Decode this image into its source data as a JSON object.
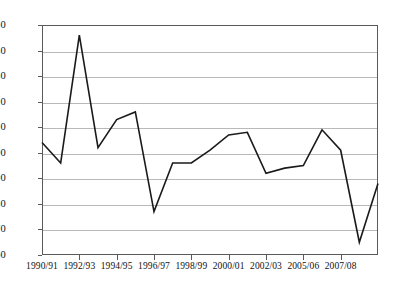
{
  "chart_data": {
    "type": "line",
    "title": "",
    "subtitle": "",
    "xlabel": "",
    "ylabel": "",
    "grid": true,
    "legend": "none",
    "ylim": [
      60,
      150
    ],
    "ytick_step": 10,
    "yticks": [
      60,
      70,
      80,
      90,
      100,
      110,
      120,
      130,
      140,
      150
    ],
    "ytick_labels": [
      "60",
      "70",
      "80",
      "90",
      "100",
      "110",
      "120",
      "130",
      "140",
      "150"
    ],
    "categories": [
      "1990/91",
      "1991/92",
      "1992/93",
      "1993/94",
      "1994/95",
      "1995/96",
      "1996/97",
      "1997/98",
      "1998/99",
      "1999/00",
      "2000/01",
      "2001/02",
      "2002/03",
      "2003/04",
      "2004/05",
      "2005/06",
      "2006/07",
      "2007/08",
      "2008/09"
    ],
    "xtick_labels": [
      "1990/91",
      "1992/93",
      "1994/95",
      "1996/97",
      "1998/99",
      "2000/01",
      "2002/03",
      "2005/06",
      "2007/08"
    ],
    "xtick_indices": [
      0,
      2,
      4,
      6,
      8,
      10,
      12,
      14,
      16
    ],
    "values": [
      104,
      96,
      146,
      102,
      113,
      116,
      77,
      96,
      96,
      101,
      107,
      108,
      92,
      94,
      95,
      109,
      101,
      65,
      88
    ],
    "series": [
      {
        "name": "index",
        "color": "#1a1a1a",
        "values": [
          104,
          96,
          146,
          102,
          113,
          116,
          77,
          96,
          96,
          101,
          107,
          108,
          92,
          94,
          95,
          109,
          101,
          65,
          88
        ]
      }
    ],
    "colors": {
      "line": "#1a1a1a",
      "grid": "#b9b9b9",
      "axis": "#5a5a5a",
      "background": "#ffffff",
      "text": "#111111"
    }
  }
}
